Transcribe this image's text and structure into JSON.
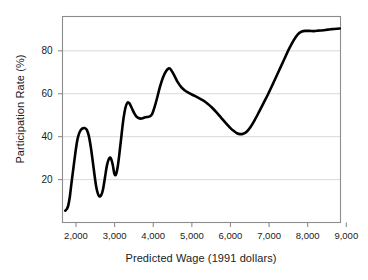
{
  "chart_data": {
    "type": "line",
    "title": "",
    "xlabel": "Predicted Wage (1991 dollars)",
    "ylabel": "Participation Rate (%)",
    "xlim": [
      1650,
      8850
    ],
    "ylim": [
      0,
      96
    ],
    "grid": true,
    "legend": false,
    "line_color": "#000000",
    "grid_color": "#d9d9d9",
    "frame_color": "#8c8c8c",
    "xticks": [
      2000,
      3000,
      4000,
      5000,
      6000,
      7000,
      8000,
      9000
    ],
    "xtick_labels": [
      "2,000",
      "3,000",
      "4,000",
      "5,000",
      "6,000",
      "7,000",
      "8,000",
      "9,000"
    ],
    "yticks": [
      20,
      40,
      60,
      80
    ],
    "ytick_labels": [
      "20",
      "40",
      "60",
      "80"
    ],
    "series": [
      {
        "name": "Participation Rate",
        "x": [
          1720,
          1760,
          1800,
          1840,
          1880,
          1930,
          1980,
          2030,
          2080,
          2130,
          2180,
          2230,
          2280,
          2330,
          2380,
          2430,
          2480,
          2520,
          2560,
          2600,
          2650,
          2700,
          2750,
          2800,
          2850,
          2900,
          2950,
          2990,
          3030,
          3080,
          3130,
          3180,
          3230,
          3280,
          3330,
          3380,
          3440,
          3500,
          3560,
          3620,
          3680,
          3730,
          3790,
          3850,
          3910,
          3970,
          4030,
          4100,
          4170,
          4250,
          4330,
          4400,
          4440,
          4490,
          4560,
          4630,
          4720,
          4820,
          4930,
          5040,
          5160,
          5280,
          5400,
          5520,
          5640,
          5760,
          5880,
          6000,
          6090,
          6170,
          6250,
          6330,
          6420,
          6520,
          6620,
          6730,
          6850,
          6980,
          7110,
          7250,
          7390,
          7520,
          7640,
          7750,
          7850,
          7950,
          8050,
          8160,
          8280,
          8400,
          8520,
          8640,
          8760,
          8830
        ],
        "y": [
          5.5,
          6.2,
          8.0,
          12.0,
          18.0,
          25.0,
          32.0,
          38.0,
          41.5,
          43.2,
          43.9,
          44.0,
          43.2,
          40.5,
          35.5,
          29.0,
          22.0,
          17.0,
          13.8,
          12.3,
          12.6,
          15.5,
          21.0,
          26.5,
          29.6,
          30.0,
          27.0,
          23.0,
          22.2,
          26.0,
          33.0,
          41.0,
          48.5,
          53.5,
          55.8,
          55.6,
          53.5,
          51.2,
          49.5,
          48.7,
          48.4,
          48.6,
          49.0,
          49.2,
          49.4,
          50.5,
          53.5,
          58.0,
          63.0,
          67.5,
          70.5,
          71.8,
          71.6,
          70.3,
          68.0,
          65.5,
          63.2,
          61.5,
          60.3,
          59.3,
          58.2,
          57.0,
          55.5,
          53.6,
          51.3,
          48.8,
          46.3,
          44.0,
          42.6,
          41.6,
          41.2,
          41.4,
          42.3,
          44.5,
          47.5,
          51.2,
          55.4,
          60.0,
          65.0,
          70.5,
          76.0,
          81.0,
          85.0,
          87.8,
          89.0,
          89.3,
          89.3,
          89.2,
          89.4,
          89.6,
          89.9,
          90.1,
          90.3,
          90.4
        ]
      }
    ]
  },
  "axes": {
    "y_title": "Participation Rate (%)",
    "x_title": "Predicted Wage (1991 dollars)"
  }
}
